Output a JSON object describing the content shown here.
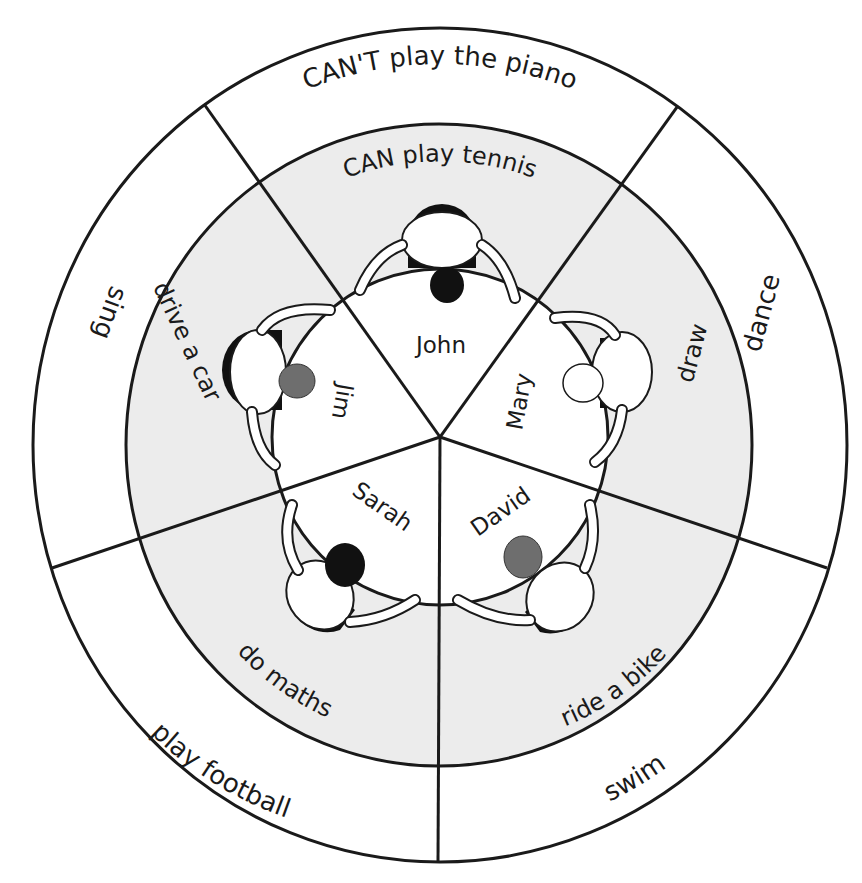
{
  "diagram": {
    "title_fragment": "…",
    "colors": {
      "background": "#ffffff",
      "middle_ring_fill": "#ececec",
      "line": "#1a1a1a",
      "hair_dark": "#111111",
      "hair_gray": "#6e6e6e"
    },
    "center_label": "",
    "outer_ring": {
      "description": "CAN'T (outer ring)",
      "labels": {
        "top": "CAN'T play the piano",
        "right": "dance",
        "bottom_right": "swim",
        "bottom_left": "play football",
        "left": "sing"
      }
    },
    "middle_ring": {
      "description": "CAN (middle ring)",
      "labels": {
        "top": "CAN play tennis",
        "right": "draw",
        "bottom_right": "ride a bike",
        "bottom_left": "do maths",
        "left": "drive a car"
      }
    },
    "inner_circle": {
      "description": "names at the table",
      "names": {
        "top": "John",
        "right": "Mary",
        "bottom_right": "David",
        "bottom_left": "Sarah",
        "left": "Jim"
      }
    },
    "people": [
      {
        "name": "John",
        "position": "top",
        "hair": "dark"
      },
      {
        "name": "Mary",
        "position": "right",
        "hair": "light curly"
      },
      {
        "name": "David",
        "position": "bottom-right",
        "hair": "gray"
      },
      {
        "name": "Sarah",
        "position": "bottom-left",
        "hair": "dark curly"
      },
      {
        "name": "Jim",
        "position": "left",
        "hair": "gray"
      }
    ]
  }
}
